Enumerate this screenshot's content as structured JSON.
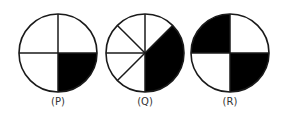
{
  "figures": [
    {
      "label": "(P)",
      "cx": 58,
      "cy": 53,
      "r": 39,
      "dividers": [
        0,
        90,
        180,
        270
      ],
      "shaded": [
        [
          90,
          180
        ]
      ]
    },
    {
      "label": "(Q)",
      "cx": 145,
      "cy": 53,
      "r": 39,
      "dividers": [
        0,
        45,
        180,
        225,
        270,
        315
      ],
      "shaded": [
        [
          45,
          180
        ]
      ]
    },
    {
      "label": "(R)",
      "cx": 230,
      "cy": 53,
      "r": 39,
      "dividers": [
        0,
        90,
        180,
        270
      ],
      "shaded": [
        [
          270,
          360
        ],
        [
          90,
          180
        ]
      ]
    }
  ],
  "colors": {
    "stroke": "#1a1a1a",
    "fill": "#000000",
    "background": "#ffffff"
  }
}
